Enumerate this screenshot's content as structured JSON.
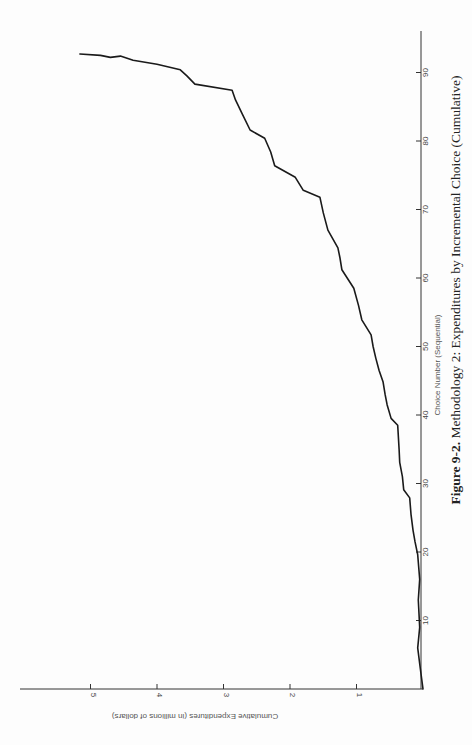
{
  "page": {
    "page_number_fragment": "",
    "caption": {
      "label": "Figure 9-2.",
      "text": " Methodology 2: Expenditures by Incremental Choice (Cumulative)"
    }
  },
  "chart_data": {
    "type": "line",
    "title": "Figure 9-2. Methodology 2: Expenditures by Incremental Choice (Cumulative)",
    "xlabel": "Choice Number (Sequential)",
    "ylabel": "Cumulative Expenditures (in millions of dollars)",
    "orientation": "figure rotated 90 degrees on the page (x-axis runs bottom-to-top along right edge, y-axis runs right-to-left along bottom)",
    "xlim": [
      0,
      96
    ],
    "ylim": [
      0,
      6
    ],
    "x_ticks": [
      10,
      20,
      30,
      40,
      50,
      60,
      70,
      80,
      90
    ],
    "y_ticks": [
      1,
      2,
      3,
      4,
      5
    ],
    "grid": false,
    "legend": null,
    "series": [
      {
        "name": "Cumulative Expenditures",
        "x": [
          0,
          3,
          6,
          9,
          13,
          16,
          19.6,
          21.5,
          23.2,
          25.5,
          27.9,
          29.1,
          31,
          33.1,
          35,
          38.5,
          39.5,
          41.5,
          43,
          44.8,
          46.5,
          48.3,
          50,
          51.7,
          53.9,
          56,
          58.5,
          61.2,
          63,
          64.4,
          67,
          69.5,
          71.8,
          72.8,
          74.7,
          76.4,
          78.4,
          80.4,
          81.6,
          84,
          86,
          87.4,
          88.3,
          89.5,
          90.4,
          91.2,
          91.8,
          92.4,
          92.2,
          92.5,
          92.7
        ],
        "y": [
          0,
          0.04,
          0.08,
          0.05,
          0.07,
          0.05,
          0.08,
          0.12,
          0.15,
          0.18,
          0.2,
          0.29,
          0.31,
          0.35,
          0.36,
          0.38,
          0.48,
          0.54,
          0.57,
          0.6,
          0.66,
          0.71,
          0.75,
          0.78,
          0.92,
          0.97,
          1.04,
          1.22,
          1.25,
          1.28,
          1.43,
          1.5,
          1.55,
          1.8,
          1.92,
          2.23,
          2.29,
          2.38,
          2.6,
          2.72,
          2.82,
          2.87,
          3.43,
          3.55,
          3.65,
          4.0,
          4.36,
          4.55,
          4.7,
          4.85,
          5.16
        ]
      }
    ]
  }
}
